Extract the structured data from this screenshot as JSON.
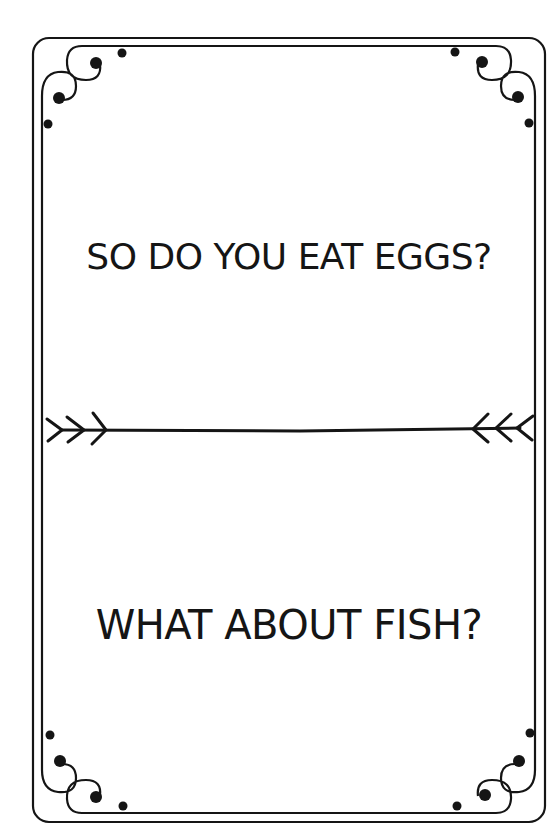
{
  "card": {
    "top_question": "SO DO YOU EAT EGGS?",
    "bottom_question": "WHAT ABOUT FISH?",
    "divider": {
      "type": "arrow-divider",
      "left_glyph": ">>>",
      "right_glyph": "<<<"
    },
    "ornaments": [
      "top-left-flourish",
      "top-right-flourish",
      "bottom-left-flourish",
      "bottom-right-flourish"
    ]
  },
  "colors": {
    "background": "#ffffff",
    "ink": "#151515"
  }
}
